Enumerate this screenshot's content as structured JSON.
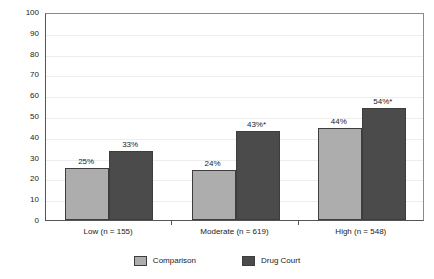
{
  "chart_data": {
    "type": "bar",
    "title": "",
    "xlabel": "",
    "ylabel": "Recidivism (Percentage)",
    "ylim": [
      0,
      100
    ],
    "ytick_labels": [
      "100",
      "90",
      "80",
      "70",
      "60",
      "50",
      "40",
      "30",
      "20",
      "10",
      "0"
    ],
    "ytick_values": [
      100,
      90,
      80,
      70,
      60,
      50,
      40,
      30,
      20,
      10,
      0
    ],
    "grid": true,
    "legend_position": "bottom-center",
    "categories": [
      "Low (n = 155)",
      "Moderate (n = 619)",
      "High (n = 548)"
    ],
    "series": [
      {
        "name": "Comparison",
        "color": "#adadad",
        "values": [
          25,
          24,
          44
        ],
        "data_labels": [
          "25%",
          "24%",
          "44%"
        ]
      },
      {
        "name": "Drug Court",
        "color": "#4b4b4b",
        "values": [
          33,
          43,
          54
        ],
        "data_labels": [
          "33%",
          "43%*",
          "54%*"
        ]
      }
    ]
  },
  "legend": {
    "items": [
      {
        "label": "Comparison",
        "color": "#adadad"
      },
      {
        "label": "Drug Court",
        "color": "#4b4b4b"
      }
    ]
  }
}
